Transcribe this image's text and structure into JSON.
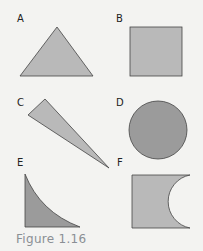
{
  "figure": {
    "caption": "Figure 1.16",
    "colors": {
      "background": "#f3f3f1",
      "light_fill": "#b9b9b9",
      "dark_fill": "#9b9b9b",
      "stroke": "#444444",
      "caption": "#8a8f94"
    },
    "shapes": [
      {
        "label": "A",
        "kind": "triangle"
      },
      {
        "label": "B",
        "kind": "square"
      },
      {
        "label": "C",
        "kind": "thin-triangle"
      },
      {
        "label": "D",
        "kind": "circle"
      },
      {
        "label": "E",
        "kind": "curved-triangle"
      },
      {
        "label": "F",
        "kind": "square-with-semicircle-cutout"
      }
    ]
  }
}
